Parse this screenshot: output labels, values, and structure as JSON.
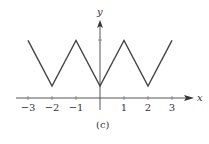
{
  "chart_data": {
    "type": "line",
    "title": "",
    "caption": "(c)",
    "xlabel": "x",
    "ylabel": "y",
    "x_ticks": [
      -3,
      -2,
      -1,
      1,
      2,
      3
    ],
    "x_tick_labels": [
      "−3",
      "−2",
      "−1",
      "1",
      "2",
      "3"
    ],
    "xlim": [
      -3.5,
      3.8
    ],
    "ylim": [
      0,
      3
    ],
    "grid": false,
    "legend": null,
    "series": [
      {
        "name": "triangle wave",
        "x": [
          -3,
          -2,
          -1,
          0,
          1,
          2,
          3
        ],
        "y": [
          2.4,
          0.5,
          2.4,
          0.5,
          2.4,
          0.5,
          2.4
        ]
      }
    ],
    "y_tick_marks": [
      2.4
    ]
  }
}
